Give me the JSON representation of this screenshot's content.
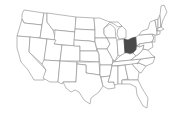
{
  "map": {
    "region": "Contiguous United States",
    "highlighted_state": "Ohio",
    "colors": {
      "background": "#ffffff",
      "state_fill": "#ffffff",
      "state_border": "#8a8a8a",
      "highlight_fill": "#4a4a4a"
    }
  }
}
